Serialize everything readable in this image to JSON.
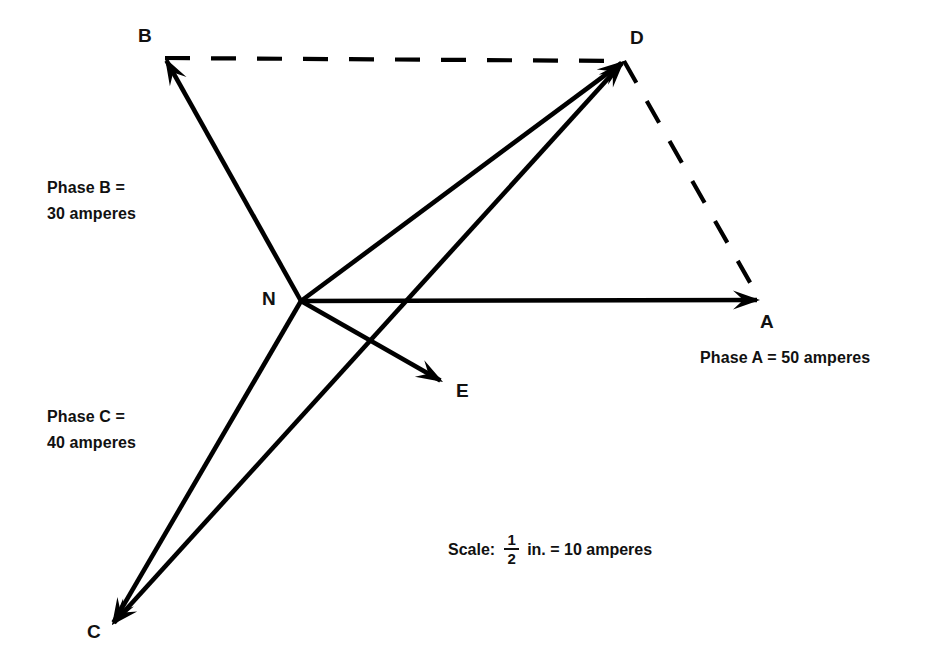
{
  "canvas": {
    "width": 941,
    "height": 671,
    "background": "#ffffff",
    "ink": "#000000"
  },
  "figure": {
    "kind": "phasor-vector-diagram",
    "title_visible": false,
    "points": {
      "N": {
        "label": "N",
        "x": 301,
        "y": 301,
        "label_x": 262,
        "label_y": 289
      },
      "A": {
        "label": "A",
        "x": 760,
        "y": 300,
        "label_x": 760,
        "label_y": 312
      },
      "B": {
        "label": "B",
        "x": 165,
        "y": 58,
        "label_x": 138,
        "label_y": 26
      },
      "C": {
        "label": "C",
        "x": 112,
        "y": 625,
        "label_x": 87,
        "label_y": 622
      },
      "D": {
        "label": "D",
        "x": 624,
        "y": 61,
        "label_x": 630,
        "label_y": 28
      },
      "E": {
        "label": "E",
        "x": 443,
        "y": 382,
        "label_x": 456,
        "label_y": 381
      }
    },
    "vectors": [
      {
        "name": "N-to-A",
        "from": "N",
        "to": "A",
        "style": "solid",
        "arrow": "to"
      },
      {
        "name": "N-to-B",
        "from": "N",
        "to": "B",
        "style": "solid",
        "arrow": "to"
      },
      {
        "name": "N-to-C",
        "from": "N",
        "to": "C",
        "style": "solid",
        "arrow": "to"
      },
      {
        "name": "N-to-D",
        "from": "N",
        "to": "D",
        "style": "solid",
        "arrow": "to"
      },
      {
        "name": "N-to-E",
        "from": "N",
        "to": "E",
        "style": "solid",
        "arrow": "to"
      },
      {
        "name": "C-to-D",
        "from": "C",
        "to": "D",
        "style": "solid",
        "arrow": "both"
      },
      {
        "name": "B-to-D",
        "from": "B",
        "to": "D",
        "style": "dashed",
        "arrow": "none"
      },
      {
        "name": "D-to-A",
        "from": "D",
        "to": "A",
        "style": "dashed",
        "arrow": "none"
      }
    ],
    "annotations": {
      "phase_b": {
        "lines": [
          "Phase B =",
          "30 amperes"
        ],
        "x": 47,
        "y": 175
      },
      "phase_c": {
        "lines": [
          "Phase C =",
          "40 amperes"
        ],
        "x": 47,
        "y": 404
      },
      "phase_a": {
        "text": "Phase A = 50 amperes",
        "x": 700,
        "y": 345
      },
      "scale": {
        "word": "Scale:",
        "numerator": "1",
        "denominator": "2",
        "tail": "in. = 10 amperes",
        "x": 448,
        "y": 533
      }
    }
  },
  "chart_data": {
    "type": "scatter",
    "xlabel": "",
    "ylabel": "",
    "scale_statement": "1/2 in. = 10 amperes",
    "origin": "N",
    "series": [
      {
        "name": "Phase A",
        "magnitude_amperes": 50,
        "from": "N",
        "to": "A",
        "direction": "right (0 degrees)"
      },
      {
        "name": "Phase B",
        "magnitude_amperes": 30,
        "from": "N",
        "to": "B",
        "direction": "upper-left"
      },
      {
        "name": "Phase C",
        "magnitude_amperes": 40,
        "from": "N",
        "to": "C",
        "direction": "lower-left"
      }
    ],
    "resultants": [
      {
        "name": "N-D",
        "from": "N",
        "to": "D",
        "note": "parallelogram resultant of A and B"
      },
      {
        "name": "N-E",
        "from": "N",
        "to": "E",
        "note": "resultant toward E"
      },
      {
        "name": "C-D",
        "from": "C",
        "to": "D",
        "note": "double-headed construction line through E"
      }
    ],
    "construction_lines": [
      {
        "name": "B-D",
        "style": "dashed"
      },
      {
        "name": "D-A",
        "style": "dashed"
      }
    ],
    "legend_position": "none",
    "grid": false
  }
}
